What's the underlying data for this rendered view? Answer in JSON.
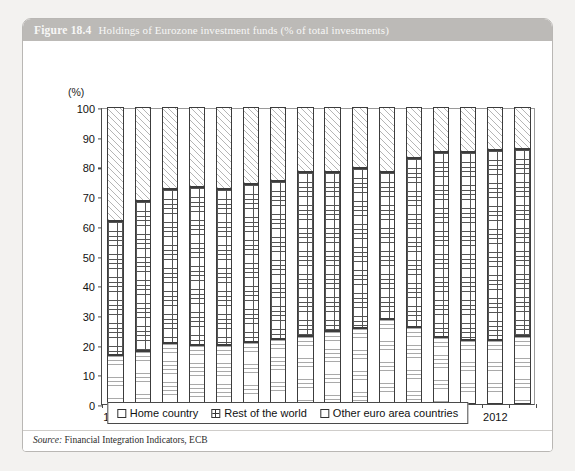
{
  "figure": {
    "number": "Figure 18.4",
    "title": "Holdings of Eurozone investment funds (% of total investments)",
    "source_label": "Source:",
    "source_text": "Financial Integration Indicators, ECB"
  },
  "chart_data": {
    "type": "bar",
    "stacked": true,
    "title": "Holdings of Eurozone investment funds (% of total investments)",
    "xlabel": "",
    "ylabel": "(%)",
    "yunit": "(%)",
    "ylim": [
      0,
      100
    ],
    "ytick_step": 10,
    "yticks": [
      0,
      10,
      20,
      30,
      40,
      50,
      60,
      70,
      80,
      90,
      100
    ],
    "grid": false,
    "legend_position": "bottom",
    "categories": [
      "1998",
      "1999",
      "2000",
      "2001",
      "2002",
      "2003",
      "2004",
      "2005",
      "2006",
      "2007",
      "2008",
      "2009",
      "2010",
      "2011",
      "2012",
      "2013"
    ],
    "xtick_labels": [
      "1998",
      "2000",
      "2002",
      "2004",
      "2006",
      "2008",
      "2010",
      "2012"
    ],
    "series": [
      {
        "name": "Home country",
        "pattern": "horizontal-lines",
        "values": [
          16.5,
          18.0,
          20.5,
          20.0,
          20.0,
          21.0,
          22.0,
          23.0,
          24.5,
          25.5,
          28.5,
          26.0,
          22.5,
          21.5,
          21.5,
          23.0
        ]
      },
      {
        "name": "Rest of the world",
        "pattern": "cross-hatch",
        "values": [
          45.0,
          50.5,
          52.0,
          53.0,
          52.5,
          53.0,
          53.0,
          55.0,
          53.5,
          54.0,
          49.5,
          57.0,
          62.5,
          63.5,
          64.0,
          63.0
        ]
      },
      {
        "name": "Other euro area countries",
        "pattern": "diagonal-hatch",
        "values": [
          38.5,
          31.5,
          27.5,
          27.0,
          27.5,
          26.0,
          25.0,
          22.0,
          22.0,
          20.5,
          22.0,
          17.0,
          15.0,
          15.0,
          14.5,
          14.0
        ]
      }
    ],
    "cumulative_tops": {
      "home": [
        16.5,
        18.0,
        20.5,
        20.0,
        20.0,
        21.0,
        22.0,
        23.0,
        24.5,
        25.5,
        28.5,
        26.0,
        22.5,
        21.5,
        21.5,
        23.0
      ],
      "home_plus_rest": [
        61.5,
        68.5,
        72.5,
        73.0,
        72.5,
        74.0,
        75.0,
        78.0,
        78.0,
        79.5,
        78.0,
        83.0,
        85.0,
        85.0,
        85.5,
        86.0
      ],
      "total": [
        100,
        100,
        100,
        100,
        100,
        100,
        100,
        100,
        100,
        100,
        100,
        100,
        100,
        100,
        100,
        100
      ]
    }
  },
  "legend": {
    "items": [
      {
        "label": "Home country"
      },
      {
        "label": "Rest of the world"
      },
      {
        "label": "Other euro area countries"
      }
    ]
  },
  "colors": {
    "titlebar": "#bcbab7",
    "card_border": "#b9b7b4",
    "page_bg": "#f3f2f0",
    "axis": "#4a4a4a",
    "bar_outline": "#3c3c3c"
  }
}
